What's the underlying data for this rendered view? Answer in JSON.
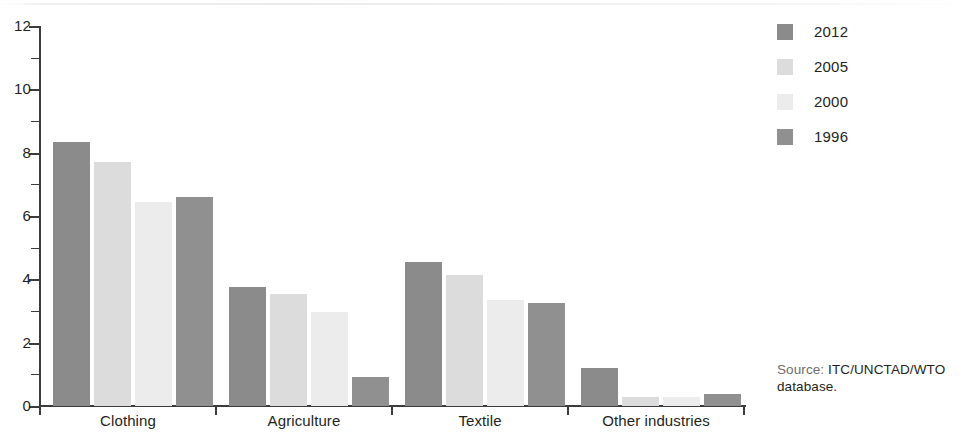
{
  "chart_data": {
    "type": "bar",
    "title": "",
    "xlabel": "",
    "ylabel": "",
    "ylim": [
      0,
      12
    ],
    "ytick_step": 2,
    "yminor_step": 1,
    "grid": false,
    "legend_position": "right-top",
    "categories": [
      "Clothing",
      "Agriculture",
      "Textile",
      "Other industries"
    ],
    "ytick_labels": [
      "0",
      "2",
      "4",
      "6",
      "8",
      "10",
      "12"
    ],
    "series": [
      {
        "name": "2012",
        "color": "#8b8b8b",
        "values": [
          8.35,
          3.75,
          4.55,
          1.2
        ]
      },
      {
        "name": "2005",
        "color": "#dcdcdc",
        "values": [
          7.7,
          3.55,
          4.15,
          0.3
        ]
      },
      {
        "name": "2000",
        "color": "#ececec",
        "values": [
          6.45,
          2.98,
          3.34,
          0.28
        ]
      },
      {
        "name": "1996",
        "color": "#909090",
        "values": [
          6.6,
          0.92,
          3.25,
          0.38
        ]
      }
    ]
  },
  "legend": {
    "items": [
      {
        "label": "2012",
        "color": "#8b8b8b"
      },
      {
        "label": "2005",
        "color": "#dcdcdc"
      },
      {
        "label": "2000",
        "color": "#ececec"
      },
      {
        "label": "1996",
        "color": "#909090"
      }
    ]
  },
  "source": {
    "label": "Source:",
    "value": "ITC/UNCTAD/WTO database."
  }
}
